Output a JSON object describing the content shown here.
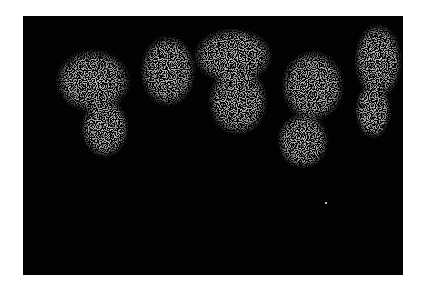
{
  "image": {
    "description": "Black rectangular field with several grainy gray speckled blob clusters along the upper half",
    "background_color": "#020202",
    "speckle_color": "#8a8a8a",
    "page_background": "#ffffff",
    "frame": {
      "x": 23,
      "y": 16,
      "width": 380,
      "height": 259
    },
    "blobs": [
      {
        "cx": 70,
        "cy": 65,
        "rx": 38,
        "ry": 32
      },
      {
        "cx": 82,
        "cy": 112,
        "rx": 24,
        "ry": 30
      },
      {
        "cx": 145,
        "cy": 55,
        "rx": 28,
        "ry": 36
      },
      {
        "cx": 210,
        "cy": 40,
        "rx": 40,
        "ry": 28
      },
      {
        "cx": 215,
        "cy": 85,
        "rx": 30,
        "ry": 35
      },
      {
        "cx": 290,
        "cy": 70,
        "rx": 32,
        "ry": 36
      },
      {
        "cx": 280,
        "cy": 125,
        "rx": 26,
        "ry": 28
      },
      {
        "cx": 355,
        "cy": 45,
        "rx": 24,
        "ry": 38
      },
      {
        "cx": 350,
        "cy": 95,
        "rx": 18,
        "ry": 28
      }
    ],
    "isolated_dot": {
      "x": 302,
      "y": 186
    }
  }
}
